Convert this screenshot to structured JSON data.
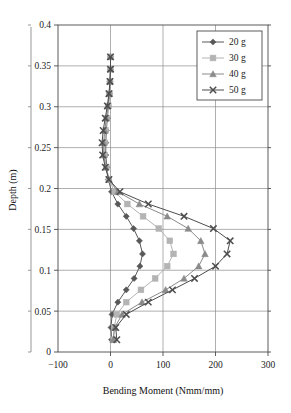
{
  "chart_data": {
    "type": "line",
    "title": "",
    "xlabel": "Bending Moment (Nmm/mm)",
    "ylabel": "Depth (m)",
    "xlim": [
      -100,
      300
    ],
    "ylim": [
      0,
      0.4
    ],
    "xticks": [
      "-100",
      "0",
      "100",
      "200",
      "300"
    ],
    "xtick_values": [
      -100,
      0,
      100,
      200,
      300
    ],
    "yticks": [
      "0",
      "0.05",
      "0.1",
      "0.15",
      "0.2",
      "0.25",
      "0.3",
      "0.35",
      "0.4"
    ],
    "ytick_values": [
      0,
      0.05,
      0.1,
      0.15,
      0.2,
      0.25,
      0.3,
      0.35,
      0.4
    ],
    "grid": true,
    "legend_position": "top-right",
    "orientation": "x = Bending Moment, y = Depth",
    "series": [
      {
        "name": "20 g",
        "marker": "diamond",
        "color": "#585858",
        "points": [
          {
            "x": 2,
            "y": 0.015
          },
          {
            "x": 1,
            "y": 0.03
          },
          {
            "x": 3,
            "y": 0.046
          },
          {
            "x": 14,
            "y": 0.061
          },
          {
            "x": 30,
            "y": 0.076
          },
          {
            "x": 45,
            "y": 0.09
          },
          {
            "x": 56,
            "y": 0.105
          },
          {
            "x": 61,
            "y": 0.12
          },
          {
            "x": 55,
            "y": 0.136
          },
          {
            "x": 44,
            "y": 0.151
          },
          {
            "x": 30,
            "y": 0.166
          },
          {
            "x": 14,
            "y": 0.181
          },
          {
            "x": 2,
            "y": 0.196
          },
          {
            "x": -4,
            "y": 0.211
          },
          {
            "x": -7,
            "y": 0.226
          },
          {
            "x": -9,
            "y": 0.241
          },
          {
            "x": -9,
            "y": 0.256
          },
          {
            "x": -8,
            "y": 0.271
          },
          {
            "x": -6,
            "y": 0.286
          },
          {
            "x": -4,
            "y": 0.301
          },
          {
            "x": -2,
            "y": 0.316
          },
          {
            "x": -1,
            "y": 0.331
          },
          {
            "x": 0,
            "y": 0.346
          },
          {
            "x": 0,
            "y": 0.361
          }
        ]
      },
      {
        "name": "30 g",
        "marker": "square",
        "color": "#b4b4b4",
        "points": [
          {
            "x": 6,
            "y": 0.015
          },
          {
            "x": 7,
            "y": 0.03
          },
          {
            "x": 12,
            "y": 0.046
          },
          {
            "x": 30,
            "y": 0.061
          },
          {
            "x": 58,
            "y": 0.076
          },
          {
            "x": 85,
            "y": 0.09
          },
          {
            "x": 108,
            "y": 0.105
          },
          {
            "x": 120,
            "y": 0.12
          },
          {
            "x": 113,
            "y": 0.136
          },
          {
            "x": 92,
            "y": 0.151
          },
          {
            "x": 62,
            "y": 0.166
          },
          {
            "x": 32,
            "y": 0.181
          },
          {
            "x": 8,
            "y": 0.196
          },
          {
            "x": -3,
            "y": 0.211
          },
          {
            "x": -8,
            "y": 0.226
          },
          {
            "x": -11,
            "y": 0.241
          },
          {
            "x": -11,
            "y": 0.256
          },
          {
            "x": -9,
            "y": 0.271
          },
          {
            "x": -7,
            "y": 0.286
          },
          {
            "x": -4,
            "y": 0.301
          },
          {
            "x": -2,
            "y": 0.316
          },
          {
            "x": -1,
            "y": 0.331
          },
          {
            "x": 0,
            "y": 0.346
          },
          {
            "x": 0,
            "y": 0.361
          }
        ]
      },
      {
        "name": "40 g",
        "marker": "triangle",
        "color": "#8a8a8a",
        "points": [
          {
            "x": 5,
            "y": 0.015
          },
          {
            "x": 8,
            "y": 0.03
          },
          {
            "x": 22,
            "y": 0.046
          },
          {
            "x": 60,
            "y": 0.061
          },
          {
            "x": 105,
            "y": 0.076
          },
          {
            "x": 140,
            "y": 0.09
          },
          {
            "x": 168,
            "y": 0.105
          },
          {
            "x": 180,
            "y": 0.12
          },
          {
            "x": 172,
            "y": 0.136
          },
          {
            "x": 148,
            "y": 0.151
          },
          {
            "x": 108,
            "y": 0.166
          },
          {
            "x": 55,
            "y": 0.181
          },
          {
            "x": 14,
            "y": 0.196
          },
          {
            "x": -3,
            "y": 0.211
          },
          {
            "x": -9,
            "y": 0.226
          },
          {
            "x": -13,
            "y": 0.241
          },
          {
            "x": -13,
            "y": 0.256
          },
          {
            "x": -11,
            "y": 0.271
          },
          {
            "x": -8,
            "y": 0.286
          },
          {
            "x": -5,
            "y": 0.301
          },
          {
            "x": -2,
            "y": 0.316
          },
          {
            "x": -1,
            "y": 0.331
          },
          {
            "x": 0,
            "y": 0.346
          },
          {
            "x": 0,
            "y": 0.361
          }
        ]
      },
      {
        "name": "50 g",
        "marker": "cross",
        "color": "#4d4d4d",
        "points": [
          {
            "x": 12,
            "y": 0.015
          },
          {
            "x": 10,
            "y": 0.03
          },
          {
            "x": 30,
            "y": 0.046
          },
          {
            "x": 72,
            "y": 0.061
          },
          {
            "x": 118,
            "y": 0.076
          },
          {
            "x": 160,
            "y": 0.09
          },
          {
            "x": 200,
            "y": 0.105
          },
          {
            "x": 222,
            "y": 0.12
          },
          {
            "x": 228,
            "y": 0.136
          },
          {
            "x": 196,
            "y": 0.151
          },
          {
            "x": 140,
            "y": 0.166
          },
          {
            "x": 72,
            "y": 0.181
          },
          {
            "x": 18,
            "y": 0.196
          },
          {
            "x": -3,
            "y": 0.211
          },
          {
            "x": -10,
            "y": 0.226
          },
          {
            "x": -15,
            "y": 0.241
          },
          {
            "x": -16,
            "y": 0.256
          },
          {
            "x": -14,
            "y": 0.271
          },
          {
            "x": -10,
            "y": 0.286
          },
          {
            "x": -6,
            "y": 0.301
          },
          {
            "x": -3,
            "y": 0.316
          },
          {
            "x": -1,
            "y": 0.331
          },
          {
            "x": 0,
            "y": 0.346
          },
          {
            "x": 0,
            "y": 0.361
          }
        ]
      }
    ]
  },
  "legend": {
    "entries": [
      {
        "label": "20 g"
      },
      {
        "label": "30 g"
      },
      {
        "label": "40 g"
      },
      {
        "label": "50 g"
      }
    ]
  }
}
